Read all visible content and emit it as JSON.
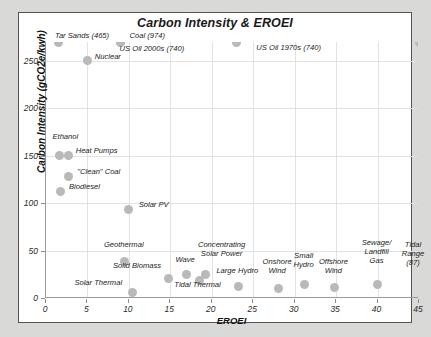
{
  "frame": {
    "border_color": "#55524f",
    "background": "#ffffff",
    "page_background": "#d9d9d7"
  },
  "chart_data": {
    "type": "scatter",
    "title": "Carbon Intensity & EROEI",
    "xlabel": "EROEI",
    "ylabel": "Carbon Intensity (gCO2e/kwh)",
    "xlim": [
      0,
      45
    ],
    "ylim": [
      0,
      270
    ],
    "xticks": [
      "0",
      "5",
      "10",
      "15",
      "20",
      "25",
      "30",
      "35",
      "40",
      "45"
    ],
    "xtick_values": [
      0,
      5,
      10,
      15,
      20,
      25,
      30,
      35,
      40,
      45
    ],
    "yticks": [
      "0",
      "50",
      "100",
      "150",
      "200",
      "250"
    ],
    "ytick_values": [
      0,
      50,
      100,
      150,
      200,
      250
    ],
    "grid": true,
    "legend": "none",
    "marker_color": "#b9b9b9",
    "points": [
      {
        "label": "Tar Sands (465)",
        "x": 1.5,
        "y": 465,
        "clipped": true,
        "lx": 1.2,
        "ly": 272,
        "align": "left"
      },
      {
        "label": "Nuclear",
        "x": 5.0,
        "y": 250,
        "clipped": false,
        "lx": 6.0,
        "ly": 250,
        "align": "left"
      },
      {
        "label": "Coal (974)",
        "x": 9.0,
        "y": 974,
        "clipped": true,
        "lx": 10.2,
        "ly": 272,
        "align": "left"
      },
      {
        "label": "US Oil 2000s (740)",
        "x": 9.0,
        "y": 740,
        "clipped": true,
        "lx": 9.0,
        "ly": 258,
        "align": "left"
      },
      {
        "label": "US Oil 1970s (740)",
        "x": 23.0,
        "y": 740,
        "clipped": true,
        "lx": 25.5,
        "ly": 259,
        "align": "left"
      },
      {
        "label": "Ethanol",
        "x": 1.6,
        "y": 150,
        "clipped": false,
        "lx": 0.9,
        "ly": 166,
        "align": "left"
      },
      {
        "label": "Heat Pumps",
        "x": 2.7,
        "y": 150,
        "clipped": false,
        "lx": 3.7,
        "ly": 151,
        "align": "left"
      },
      {
        "label": "\"Clean\" Coal",
        "x": 2.7,
        "y": 128,
        "clipped": false,
        "lx": 3.9,
        "ly": 129,
        "align": "left"
      },
      {
        "label": "Biodiesel",
        "x": 1.7,
        "y": 112,
        "clipped": false,
        "lx": 2.9,
        "ly": 113,
        "align": "left"
      },
      {
        "label": "Solar PV",
        "x": 10.0,
        "y": 93,
        "clipped": false,
        "lx": 11.3,
        "ly": 94,
        "align": "left"
      },
      {
        "label": "Geothermal",
        "x": 9.5,
        "y": 38,
        "clipped": false,
        "lx": 9.5,
        "ly": 52,
        "align": "center"
      },
      {
        "label": "Solar Thermal",
        "x": 10.4,
        "y": 6,
        "clipped": false,
        "lx": 9.3,
        "ly": 12,
        "align": "right"
      },
      {
        "label": "Solid Biomass",
        "x": 14.8,
        "y": 21,
        "clipped": false,
        "lx": 14.0,
        "ly": 30,
        "align": "right"
      },
      {
        "label": "Wave",
        "x": 17.0,
        "y": 25,
        "clipped": false,
        "lx": 16.9,
        "ly": 36,
        "align": "center"
      },
      {
        "label": "Tidal Thermal",
        "x": 18.5,
        "y": 18,
        "clipped": false,
        "lx": 18.4,
        "ly": 10,
        "align": "center"
      },
      {
        "label": "Concentrating\nSolar Power",
        "x": 19.3,
        "y": 25,
        "clipped": false,
        "lx": 21.3,
        "ly": 52,
        "align": "center"
      },
      {
        "label": "Large Hydro",
        "x": 23.2,
        "y": 12,
        "clipped": false,
        "lx": 23.2,
        "ly": 24,
        "align": "center"
      },
      {
        "label": "Onshore\nWind",
        "x": 28.0,
        "y": 10,
        "clipped": false,
        "lx": 28.0,
        "ly": 34,
        "align": "center"
      },
      {
        "label": "Small\nHydro",
        "x": 31.2,
        "y": 14,
        "clipped": false,
        "lx": 31.2,
        "ly": 40,
        "align": "center"
      },
      {
        "label": "Offshore\nWind",
        "x": 34.8,
        "y": 11,
        "clipped": false,
        "lx": 34.8,
        "ly": 34,
        "align": "center"
      },
      {
        "label": "Sewage/\nLandfill\nGas",
        "x": 40.0,
        "y": 14,
        "clipped": false,
        "lx": 40.0,
        "ly": 54,
        "align": "center"
      },
      {
        "label": "Tidal\nRange\n(87)",
        "x": 45.0,
        "y": 87,
        "clipped": true,
        "lx": 44.4,
        "ly": 52,
        "align": "center"
      }
    ]
  }
}
